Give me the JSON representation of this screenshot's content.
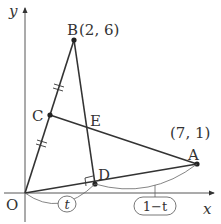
{
  "diagram": {
    "axes": {
      "x_label": "x",
      "y_label": "y",
      "origin_label": "O"
    },
    "points": {
      "O": {
        "label": "O",
        "coords": "(0, 0)"
      },
      "A": {
        "label": "A",
        "coords_text": "(7, 1)"
      },
      "B": {
        "label": "B",
        "coords_text": "(2, 6)"
      },
      "C": {
        "label": "C"
      },
      "D": {
        "label": "D"
      },
      "E": {
        "label": "E"
      }
    },
    "segment_labels": {
      "OD_ratio": "t",
      "DA_ratio": "1−t"
    },
    "annotations": {
      "OC_equals_CB": "tick marks (double)",
      "BD_perp_OA": "right angle mark at D"
    },
    "colors": {
      "line": "#333333",
      "thin_line": "#555555",
      "background": "#ffffff"
    }
  }
}
